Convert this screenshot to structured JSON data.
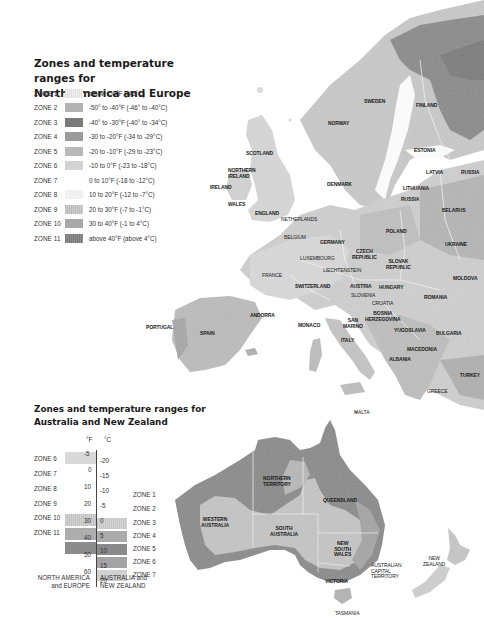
{
  "europe_legend": {
    "title_line1": "Zones and temperature ranges for",
    "title_line2": "North America and Europe",
    "zones": [
      {
        "zone": "ZONE 1",
        "range": "below -50°F (-46°C)",
        "color": "#e9e9e9"
      },
      {
        "zone": "ZONE 2",
        "range": "-50° to -40°F (-46° to -40°C)",
        "color": "#b2b2b2"
      },
      {
        "zone": "ZONE 3",
        "range": "-40° to -30°F (-40° to -34°C)",
        "color": "#7a7a7a"
      },
      {
        "zone": "ZONE 4",
        "range": "-30 to -20°F (-34 to -29°C)",
        "color": "#9a9a9a"
      },
      {
        "zone": "ZONE 5",
        "range": "-20 to -10°F (-29 to -23°C)",
        "color": "#b9b9b9"
      },
      {
        "zone": "ZONE 6",
        "range": "-10 to 0°F (-23 to -18°C)",
        "color": "#d3d3d3"
      },
      {
        "zone": "ZONE 7",
        "range": "0 to 10°F (-18 to -12°C)",
        "color": "#ffffff"
      },
      {
        "zone": "ZONE 8",
        "range": "10 to 20°F (-12 to -7°C)",
        "color": "#f1f1f1"
      },
      {
        "zone": "ZONE 9",
        "range": "20 to 30°F (-7 to -1°C)",
        "color": "#c4c4c4"
      },
      {
        "zone": "ZONE 10",
        "range": "30 to 40°F (-1 to 4°C)",
        "color": "#a9a9a9"
      },
      {
        "zone": "ZONE 11",
        "range": "above 40°F (above 4°C)",
        "color": "#858585"
      }
    ]
  },
  "australia_legend": {
    "title_line1": "Zones and temperature ranges for",
    "title_line2": "Australia and New Zealand",
    "unit_f": "°F",
    "unit_c": "°C",
    "fahrenheit_ticks": [
      "-5",
      "0",
      "10",
      "20",
      "30",
      "40",
      "50",
      "60"
    ],
    "celsius_ticks": [
      "-20",
      "-15",
      "-10",
      "-5",
      "0",
      "5",
      "10",
      "15",
      "20"
    ],
    "na_zones": [
      "ZONE 6",
      "ZONE 7",
      "ZONE 8",
      "ZONE 9",
      "ZONE 10",
      "ZONE 11"
    ],
    "au_zones": [
      "ZONE 1",
      "ZONE 2",
      "ZONE 3",
      "ZONE 4",
      "ZONE 5",
      "ZONE 6",
      "ZONE 7"
    ],
    "footer_left_line1": "NORTH AMERICA",
    "footer_left_line2": "and EUROPE",
    "footer_right_line1": "AUSTRALIA and",
    "footer_right_line2": "NEW ZEALAND"
  },
  "europe_places": {
    "sweden": "SWEDEN",
    "finland": "FINLAND",
    "norway": "NORWAY",
    "estonia": "ESTONIA",
    "latvia": "LATVIA",
    "russia_east": "RUSSIA",
    "scotland": "SCOTLAND",
    "northern_ireland_1": "NORTHERN",
    "northern_ireland_2": "IRELAND",
    "ireland": "IRELAND",
    "denmark": "DENMARK",
    "lithuania": "LITHUANIA",
    "russia_kal": "RUSSIA",
    "wales": "WALES",
    "england": "ENGLAND",
    "netherlands": "NETHERLANDS",
    "belarus": "BELARUS",
    "belgium": "BELGIUM",
    "germany": "GERMANY",
    "poland": "POLAND",
    "czech_1": "CZECH",
    "czech_2": "REPUBLIC",
    "luxembourg": "LUXEMBOURG",
    "slovak_1": "SLOVAK",
    "slovak_2": "REPUBLIC",
    "ukraine": "UKRAINE",
    "liechtenstein": "LIECHTENSTEIN",
    "france": "FRANCE",
    "moldova": "MOLDOVA",
    "switzerland": "SWITZERLAND",
    "austria": "AUSTRIA",
    "hungary": "HUNGARY",
    "slovenia": "SLOVENIA",
    "croatia": "CROATIA",
    "romania": "ROMANIA",
    "bosnia_1": "BOSNIA",
    "bosnia_2": "HERZEGOVINA",
    "yugoslavia": "YUGOSLAVIA",
    "bulgaria": "BULGARIA",
    "portugal": "PORTUGAL",
    "spain": "SPAIN",
    "andorra": "ANDORRA",
    "monaco": "MONACO",
    "san_marino_1": "SAN",
    "san_marino_2": "MARINO",
    "italy": "ITALY",
    "macedonia": "MACEDONIA",
    "albania": "ALBANIA",
    "turkey": "TURKEY",
    "greece": "GREECE",
    "malta": "MALTA"
  },
  "australia_places": {
    "nt_1": "NORTHERN",
    "nt_2": "TERRITORY",
    "queensland": "QUEENSLAND",
    "wa_1": "WESTERN",
    "wa_2": "AUSTRALIA",
    "sa_1": "SOUTH",
    "sa_2": "AUSTRALIA",
    "nsw_1": "NEW",
    "nsw_2": "SOUTH",
    "nsw_3": "WALES",
    "act_1": "AUSTRALIAN",
    "act_2": "CAPITAL",
    "act_3": "TERRITORY",
    "victoria": "VICTORIA",
    "tasmania": "TASMANIA",
    "nz_1": "NEW",
    "nz_2": "ZEALAND"
  }
}
